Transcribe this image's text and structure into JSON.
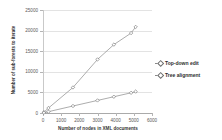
{
  "chart_data": {
    "type": "line",
    "title": "",
    "xlabel": "Number of nodes in XML documents",
    "ylabel": "Number of sub-forests to iterate",
    "xlim": [
      0,
      6000
    ],
    "ylim": [
      0,
      25000
    ],
    "xticks": [
      "0",
      "1000",
      "2000",
      "3000",
      "4000",
      "5000",
      "6000"
    ],
    "yticks": [
      "0",
      "5000",
      "10000",
      "15000",
      "20000",
      "25000"
    ],
    "grid": "horizontal",
    "legend_position": "right",
    "series": [
      {
        "name": "Top-down edit",
        "marker": "diamond",
        "color": "#8a8a8a",
        "points": [
          {
            "x": 50,
            "y": 200
          },
          {
            "x": 300,
            "y": 1200
          },
          {
            "x": 1650,
            "y": 6200
          },
          {
            "x": 3000,
            "y": 13000
          },
          {
            "x": 3900,
            "y": 16600
          },
          {
            "x": 4850,
            "y": 19400
          },
          {
            "x": 5100,
            "y": 20900
          }
        ]
      },
      {
        "name": "Tree alignment",
        "marker": "diamond",
        "color": "#8a8a8a",
        "points": [
          {
            "x": 50,
            "y": 60
          },
          {
            "x": 300,
            "y": 320
          },
          {
            "x": 1650,
            "y": 1700
          },
          {
            "x": 3000,
            "y": 3050
          },
          {
            "x": 3900,
            "y": 3950
          },
          {
            "x": 4850,
            "y": 4900
          },
          {
            "x": 5100,
            "y": 5200
          }
        ]
      }
    ]
  },
  "legend": {
    "items": [
      {
        "label": "Top-down edit"
      },
      {
        "label": "Tree alignment"
      }
    ]
  }
}
